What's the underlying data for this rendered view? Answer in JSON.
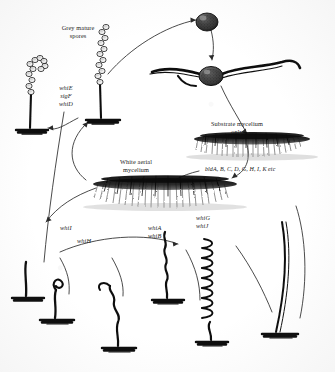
{
  "figure": {
    "ink_color": "#111111",
    "background_color": "#ffffff"
  },
  "labels": {
    "grey_mature_spores": "Grey mature\nspores",
    "grey_mature_spores_line1": "Grey mature",
    "grey_mature_spores_line2": "spores",
    "substrate_mycelium_line1": "Substrate mycelium",
    "substrate_mycelium_line2": "only",
    "white_aerial_line1": "White aerial",
    "white_aerial_line2": "mycelium"
  },
  "genes": {
    "whiE": "whiE",
    "sigF": "sigF",
    "whiD": "whiD",
    "bld_series": "bldA, B, C, D, G, H, I, K etc",
    "whiI": "whiI",
    "whiH": "whiH",
    "whiA": "whiA",
    "whiB": "whiB",
    "whiG": "whiG",
    "whiJ": "whiJ"
  },
  "structures": {
    "germinating_spore": "spore",
    "germ_tube": "germinating spore with germ tubes",
    "substrate_lawn": "substrate mycelium lawn",
    "aerial_lawn": "white aerial mycelium lawn",
    "spore_chain_left": "mature grey spore chain",
    "spore_chain_mid": "mature grey spore chain",
    "hypha_stage_1": "straight aerial hypha",
    "hypha_stage_2": "curling aerial hypha tip",
    "hypha_stage_3": "loosely coiled aerial hypha",
    "hypha_stage_4": "tightly coiled aerial hypha",
    "hypha_stage_5": "septating coiled hypha"
  }
}
